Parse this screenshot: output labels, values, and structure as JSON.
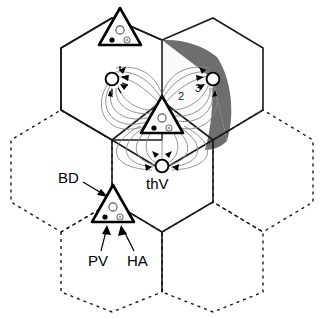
{
  "figure": {
    "background_color": "#ffffff"
  },
  "labels": {
    "bd": "BD",
    "pv": "PV",
    "ha": "HA",
    "thv": "thV",
    "band_1": "1",
    "band_2": "2",
    "band_3": "3"
  },
  "colors": {
    "outline": "#1a1a1a",
    "flux_line": "#888888",
    "band_1_fill": "#fafafa",
    "band_2_fill": "#e6e6e6",
    "band_3_fill": "#6e6e6e",
    "node_fill": "#ffffff",
    "dot_black": "#000000",
    "dot_gray": "#9a9a9a"
  },
  "legend_semantics": {
    "bd": "Building / triangle outline marker",
    "pv": "PV marker (filled black dot)",
    "ha": "HA marker (gray ringed dot)",
    "thv": "thermal / vertex node (open circle)"
  },
  "bands": [
    {
      "label": "1",
      "fill": "#fafafa",
      "x": 160,
      "y": 103
    },
    {
      "label": "2",
      "fill": "#e6e6e6",
      "x": 179,
      "y": 97
    },
    {
      "label": "3",
      "fill": "#6e6e6e",
      "x": 196,
      "y": 90
    }
  ],
  "triangles": [
    {
      "name": "triangle-top",
      "cx": 120,
      "cy": 25
    },
    {
      "name": "triangle-center",
      "cx": 162,
      "cy": 113
    },
    {
      "name": "triangle-bottom-left",
      "cx": 113,
      "cy": 202
    }
  ],
  "nodes": [
    {
      "name": "node-left",
      "cx": 112,
      "cy": 79,
      "label": ""
    },
    {
      "name": "node-right",
      "cx": 213,
      "cy": 79,
      "label": ""
    },
    {
      "name": "node-bottom",
      "cx": 162,
      "cy": 166,
      "label": "thV"
    }
  ]
}
